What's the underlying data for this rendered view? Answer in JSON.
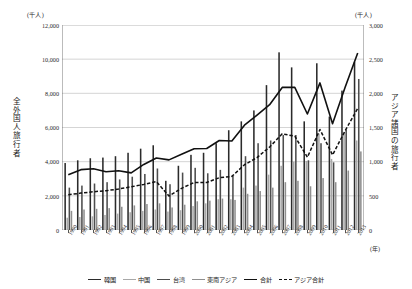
{
  "axes": {
    "left_unit": "(千人)",
    "right_unit": "(千人)",
    "left_title": "全外国人旅行者",
    "right_title": "アジア諸国の旅行者",
    "x_unit": "(年)",
    "left_ticks": [
      "12,000",
      "10,000",
      "8,000",
      "6,000",
      "4,000",
      "2,000",
      "0"
    ],
    "right_ticks": [
      "3,000",
      "2,500",
      "2,000",
      "1,500",
      "1,000",
      "500",
      "0"
    ]
  },
  "legend": [
    {
      "label": "韓国",
      "color": "#2b2b2b",
      "style": "bar-dark"
    },
    {
      "label": "中国",
      "color": "#a8a8a8",
      "style": "bar-light"
    },
    {
      "label": "台湾",
      "color": "#4d4d4d",
      "style": "bar-mid"
    },
    {
      "label": "東南アジア",
      "color": "#8f8f8f",
      "style": "bar-light2"
    },
    {
      "label": "合計",
      "color": "#111111",
      "style": "line-solid"
    },
    {
      "label": "アジア合計",
      "color": "#111111",
      "style": "line-dashed"
    }
  ],
  "chart_data": {
    "type": "bar",
    "title": "",
    "xlabel": "(年)",
    "ylabel": "全外国人旅行者 (千人)",
    "y2label": "アジア諸国の旅行者 (千人)",
    "ylim": [
      0,
      12000
    ],
    "y2lim": [
      0,
      3000
    ],
    "grid": true,
    "legend_position": "bottom",
    "categories": [
      "1990",
      "1991",
      "1992",
      "1993",
      "1994",
      "1995",
      "1996",
      "1997",
      "1998",
      "1999",
      "2000",
      "2001",
      "2002",
      "2003",
      "2004",
      "2005",
      "2006",
      "2007",
      "2008",
      "2009",
      "2010",
      "2011",
      "2012",
      "2013"
    ],
    "bar_series": [
      {
        "name": "韓国",
        "axis": "right",
        "color": "#2b2b2b",
        "values": [
          980,
          1020,
          1050,
          1060,
          1080,
          1130,
          1190,
          1240,
          720,
          940,
          1100,
          1130,
          1270,
          1460,
          1590,
          1750,
          2120,
          2600,
          2380,
          1590,
          2440,
          1660,
          2040,
          2460
        ]
      },
      {
        "name": "中国",
        "axis": "right",
        "color": "#a8a8a8",
        "values": [
          180,
          190,
          200,
          220,
          240,
          260,
          280,
          300,
          270,
          290,
          350,
          390,
          450,
          450,
          620,
          650,
          810,
          940,
          1000,
          1010,
          1410,
          1040,
          1430,
          1310
        ]
      },
      {
        "name": "台湾",
        "axis": "right",
        "color": "#4d4d4d",
        "values": [
          620,
          650,
          680,
          700,
          740,
          780,
          820,
          900,
          670,
          840,
          910,
          830,
          880,
          790,
          1080,
          1270,
          1310,
          1390,
          1390,
          1020,
          1270,
          990,
          1470,
          2210
        ]
      },
      {
        "name": "東南アジア",
        "axis": "right",
        "color": "#8f8f8f",
        "values": [
          280,
          300,
          310,
          320,
          340,
          360,
          380,
          390,
          330,
          370,
          420,
          430,
          460,
          440,
          530,
          570,
          620,
          700,
          720,
          640,
          760,
          700,
          870,
          1150
        ]
      }
    ],
    "line_series": [
      {
        "name": "合計",
        "axis": "left",
        "style": "solid",
        "color": "#111111",
        "values": [
          3236,
          3533,
          3582,
          3410,
          3468,
          3345,
          3837,
          4218,
          4106,
          4438,
          4757,
          4772,
          5239,
          5212,
          6138,
          6728,
          7334,
          8347,
          8351,
          6790,
          8611,
          6219,
          8358,
          10364
        ]
      },
      {
        "name": "アジア合計",
        "axis": "left",
        "style": "dashed",
        "color": "#111111",
        "values": [
          2060,
          2160,
          2240,
          2300,
          2400,
          2530,
          2670,
          2830,
          1990,
          2440,
          2780,
          2780,
          3060,
          3140,
          3820,
          4240,
          4860,
          5630,
          5490,
          4260,
          5880,
          4390,
          5810,
          7120
        ]
      }
    ]
  }
}
